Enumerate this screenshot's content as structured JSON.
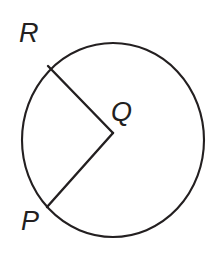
{
  "figure": {
    "background_color": "#ffffff",
    "stroke_color": "#231f20",
    "width": 218,
    "height": 254
  },
  "circle": {
    "name": "circle-outline",
    "center_x": 113,
    "center_y": 140,
    "radius_x": 91,
    "radius_y": 97,
    "stroke_width": 2.1
  },
  "labels": {
    "r": "R",
    "q": "Q",
    "p": "P"
  },
  "label_positions": {
    "r": {
      "x": 19,
      "y": 42
    },
    "q": {
      "x": 111,
      "y": 121
    },
    "p": {
      "x": 21,
      "y": 230
    }
  },
  "points": {
    "center_q": {
      "x": 113,
      "y": 133
    },
    "point_r": {
      "x": 48,
      "y": 66
    },
    "point_p": {
      "x": 47,
      "y": 207
    }
  },
  "segments": [
    {
      "name": "radius-qr",
      "from": "Q",
      "to": "R",
      "path": "M 113 133 L 48 66"
    },
    {
      "name": "radius-qp",
      "from": "Q",
      "to": "P",
      "path": "M 113 133 L 47 207"
    }
  ]
}
